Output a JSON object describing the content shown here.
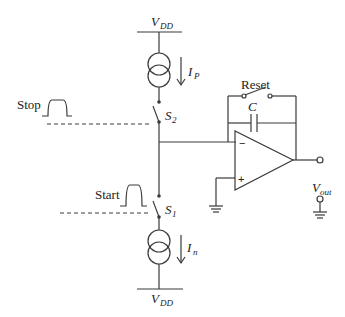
{
  "diagram": {
    "supply_top": {
      "label": "V",
      "sub": "DD"
    },
    "supply_bottom": {
      "label": "V",
      "sub": "DD"
    },
    "current_source_top": {
      "label": "I",
      "sub": "P"
    },
    "current_source_bottom": {
      "label": "I",
      "sub": "n"
    },
    "switch_top": {
      "label": "S",
      "sub": "2"
    },
    "switch_bottom": {
      "label": "S",
      "sub": "1"
    },
    "stop_signal": {
      "label": "Stop"
    },
    "start_signal": {
      "label": "Start"
    },
    "reset_switch": {
      "label": "Reset"
    },
    "capacitor": {
      "label": "C"
    },
    "opamp": {
      "minus": "−",
      "plus": "+"
    },
    "output": {
      "label": "V",
      "sub": "out"
    },
    "colors": {
      "line": "#3a3a3a",
      "text": "#222222",
      "background": "#ffffff"
    }
  }
}
